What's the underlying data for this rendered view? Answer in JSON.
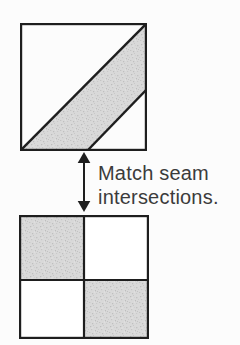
{
  "figure": {
    "instruction": {
      "line1": "Match seam",
      "line2": "intersections."
    }
  },
  "colors": {
    "background": "#fcfcfc",
    "line": "#1e1e1e",
    "text": "#3b3b3b",
    "shade": "#d9d9d9"
  }
}
